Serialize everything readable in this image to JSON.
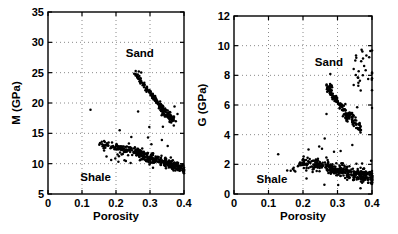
{
  "figure": {
    "width": 398,
    "height": 234,
    "background": "#ffffff",
    "ink_color": "#000000",
    "grid_color": "#8a8a8a",
    "marker_color": "#000000",
    "marker_radius": 1.25
  },
  "chart_data": [
    {
      "type": "scatter",
      "title": "",
      "xlabel": "Porosity",
      "ylabel": "M (GPa)",
      "xlim": [
        0,
        0.4
      ],
      "ylim": [
        5,
        35
      ],
      "grid": {
        "style": "dotted",
        "x": [
          0.1,
          0.2,
          0.3
        ],
        "y": [
          10,
          15,
          20,
          25,
          30
        ]
      },
      "xticks": {
        "values": [
          0,
          0.1,
          0.2,
          0.3,
          0.4
        ],
        "labels": [
          "0",
          "0.1",
          "0.2",
          "0.3",
          "0.4"
        ]
      },
      "yticks": {
        "values": [
          5,
          10,
          15,
          20,
          25,
          30,
          35
        ],
        "labels": [
          "5",
          "10",
          "15",
          "20",
          "25",
          "30",
          "35"
        ]
      },
      "plot_box": {
        "left": 48,
        "top": 12,
        "right": 184,
        "bottom": 194
      },
      "annotations": [
        {
          "id": "sand",
          "text": "Sand",
          "x": 0.27,
          "y": 28.2
        },
        {
          "id": "shale",
          "text": "Shale",
          "x": 0.14,
          "y": 7.8
        }
      ],
      "series": [
        {
          "name": "Sand trend (M vs porosity)",
          "marker": "dot",
          "clusters": [
            {
              "kind": "trend",
              "seed": 11,
              "n": 110,
              "x0": 0.258,
              "y0": 24.7,
              "x1": 0.34,
              "y1": 19.0,
              "jx": 0.004,
              "jy": 0.5
            },
            {
              "kind": "trend",
              "seed": 12,
              "n": 85,
              "x0": 0.325,
              "y0": 19.6,
              "x1": 0.37,
              "y1": 17.2,
              "jx": 0.006,
              "jy": 0.75
            }
          ],
          "points": [
            [
              0.258,
              25.25
            ],
            [
              0.267,
              25.2
            ],
            [
              0.274,
              25.05
            ],
            [
              0.125,
              18.9
            ],
            [
              0.265,
              18.6
            ],
            [
              0.298,
              16.05
            ],
            [
              0.338,
              16.1
            ],
            [
              0.37,
              16.3
            ],
            [
              0.211,
              15.5
            ],
            [
              0.245,
              14.4
            ],
            [
              0.294,
              14.3
            ],
            [
              0.304,
              13.2
            ],
            [
              0.335,
              13.9
            ],
            [
              0.352,
              12.9
            ],
            [
              0.372,
              19.4
            ],
            [
              0.381,
              18.2
            ],
            [
              0.376,
              17.0
            ]
          ]
        },
        {
          "name": "Shale trend (M vs porosity)",
          "marker": "dot",
          "clusters": [
            {
              "kind": "trend",
              "seed": 21,
              "n": 85,
              "x0": 0.152,
              "y0": 13.3,
              "x1": 0.27,
              "y1": 11.8,
              "jx": 0.003,
              "jy": 0.6
            },
            {
              "kind": "trend",
              "seed": 22,
              "n": 235,
              "x0": 0.26,
              "y0": 11.9,
              "x1": 0.405,
              "y1": 8.9,
              "jx": 0.003,
              "jy": 0.75
            },
            {
              "kind": "trend",
              "seed": 23,
              "n": 55,
              "x0": 0.2,
              "y0": 12.4,
              "x1": 0.4,
              "y1": 9.3,
              "jx": 0.004,
              "jy": 1.3
            }
          ],
          "points": [
            [
              0.165,
              12.15
            ],
            [
              0.172,
              11.2
            ],
            [
              0.186,
              10.6
            ],
            [
              0.198,
              10.85
            ],
            [
              0.207,
              10.3
            ],
            [
              0.225,
              10.55
            ],
            [
              0.243,
              10.1
            ]
          ]
        }
      ]
    },
    {
      "type": "scatter",
      "title": "",
      "xlabel": "Porosity",
      "ylabel": "G (GPa)",
      "xlim": [
        0,
        0.4
      ],
      "ylim": [
        0,
        12
      ],
      "grid": {
        "style": "dotted",
        "x": [
          0.1,
          0.2,
          0.3
        ],
        "y": [
          2,
          4,
          6,
          8,
          10
        ]
      },
      "xticks": {
        "values": [
          0,
          0.1,
          0.2,
          0.3,
          0.4
        ],
        "labels": [
          "0",
          "0.1",
          "0.2",
          "0.3",
          "0.4"
        ]
      },
      "yticks": {
        "values": [
          0,
          2,
          4,
          6,
          8,
          10,
          12
        ],
        "labels": [
          "0",
          "2",
          "4",
          "6",
          "8",
          "10",
          "12"
        ]
      },
      "plot_box": {
        "left": 234,
        "top": 16,
        "right": 372,
        "bottom": 194
      },
      "annotations": [
        {
          "id": "sand",
          "text": "Sand",
          "x": 0.275,
          "y": 8.9
        },
        {
          "id": "shale",
          "text": "Shale",
          "x": 0.11,
          "y": 1.0
        }
      ],
      "series": [
        {
          "name": "Sand trend (G vs porosity)",
          "marker": "dot",
          "clusters": [
            {
              "kind": "blob",
              "seed": 31,
              "n": 22,
              "cx": 0.276,
              "cy": 7.1,
              "rx": 0.009,
              "ry": 0.33
            },
            {
              "kind": "trend",
              "seed": 32,
              "n": 85,
              "x0": 0.27,
              "y0": 7.15,
              "x1": 0.335,
              "y1": 5.25,
              "jx": 0.004,
              "jy": 0.3
            },
            {
              "kind": "trend",
              "seed": 33,
              "n": 75,
              "x0": 0.32,
              "y0": 5.35,
              "x1": 0.366,
              "y1": 4.45,
              "jx": 0.006,
              "jy": 0.42
            },
            {
              "kind": "blob",
              "seed": 34,
              "n": 30,
              "cx": 0.377,
              "cy": 8.4,
              "rx": 0.031,
              "ry": 1.45
            }
          ],
          "points": [
            [
              0.268,
              5.4
            ],
            [
              0.279,
              8.1
            ],
            [
              0.263,
              3.75
            ],
            [
              0.309,
              2.9
            ],
            [
              0.343,
              3.3
            ],
            [
              0.402,
              5.8
            ],
            [
              0.357,
              5.85
            ]
          ]
        },
        {
          "name": "Shale trend (G vs porosity)",
          "marker": "dot",
          "clusters": [
            {
              "kind": "trend",
              "seed": 41,
              "n": 9,
              "x0": 0.155,
              "y0": 1.6,
              "x1": 0.195,
              "y1": 1.9,
              "jx": 0.003,
              "jy": 0.25
            },
            {
              "kind": "trend",
              "seed": 42,
              "n": 80,
              "x0": 0.19,
              "y0": 2.2,
              "x1": 0.285,
              "y1": 1.75,
              "jx": 0.003,
              "jy": 0.35
            },
            {
              "kind": "trend",
              "seed": 43,
              "n": 235,
              "x0": 0.27,
              "y0": 1.8,
              "x1": 0.41,
              "y1": 1.0,
              "jx": 0.003,
              "jy": 0.4
            },
            {
              "kind": "trend",
              "seed": 44,
              "n": 60,
              "x0": 0.2,
              "y0": 2.1,
              "x1": 0.41,
              "y1": 1.15,
              "jx": 0.004,
              "jy": 0.75
            }
          ],
          "points": [
            [
              0.128,
              2.68
            ],
            [
              0.216,
              3.0
            ],
            [
              0.247,
              3.2
            ],
            [
              0.255,
              3.05
            ],
            [
              0.29,
              2.85
            ],
            [
              0.262,
              0.62
            ],
            [
              0.302,
              0.6
            ]
          ]
        }
      ]
    }
  ]
}
